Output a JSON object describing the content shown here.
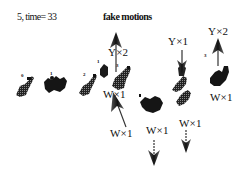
{
  "figure": {
    "caption_left": "5, time= 33",
    "title": "fake motions",
    "labels": [
      {
        "id": "y2-left",
        "text": "Y×2",
        "x": 108,
        "y": 46
      },
      {
        "id": "y1-right",
        "text": "Y×1",
        "x": 168,
        "y": 36
      },
      {
        "id": "y2-right",
        "text": "Y×2",
        "x": 208,
        "y": 26
      },
      {
        "id": "w1-mid",
        "text": "W×1",
        "x": 103,
        "y": 89
      },
      {
        "id": "w1-lower-left",
        "text": "W×1",
        "x": 110,
        "y": 128
      },
      {
        "id": "w1-lower-center",
        "text": "W×1",
        "x": 146,
        "y": 126
      },
      {
        "id": "w1-lower-right",
        "text": "W×1",
        "x": 179,
        "y": 117
      },
      {
        "id": "w1-far-right",
        "text": "W×1",
        "x": 210,
        "y": 92
      }
    ],
    "indices": [
      {
        "text": "0",
        "x": 21,
        "y": 73
      },
      {
        "text": "1",
        "x": 50,
        "y": 73
      },
      {
        "text": "2",
        "x": 83,
        "y": 73
      },
      {
        "text": "1",
        "x": 97,
        "y": 61
      },
      {
        "text": "3",
        "x": 117,
        "y": 64
      },
      {
        "text": "3",
        "x": 205,
        "y": 54
      }
    ],
    "arrows": [
      {
        "id": "arrow-up-1",
        "direction": "up",
        "x": 116,
        "y1": 72,
        "y2": 33
      },
      {
        "id": "arrow-up-2",
        "direction": "up",
        "x": 218,
        "y1": 66,
        "y2": 40
      },
      {
        "id": "arrow-down-1",
        "direction": "down",
        "x": 182,
        "y1": 50,
        "y2": 72
      },
      {
        "id": "arrow-diag-1",
        "direction": "up-left",
        "x": 118,
        "y1": 127,
        "y2": 90
      },
      {
        "id": "arrow-down-2",
        "direction": "down",
        "x": 154,
        "y1": 140,
        "y2": 165
      },
      {
        "id": "arrow-down-3",
        "direction": "down",
        "x": 186,
        "y1": 130,
        "y2": 152
      }
    ],
    "figures_count": 9,
    "ink_color": "#111111"
  }
}
